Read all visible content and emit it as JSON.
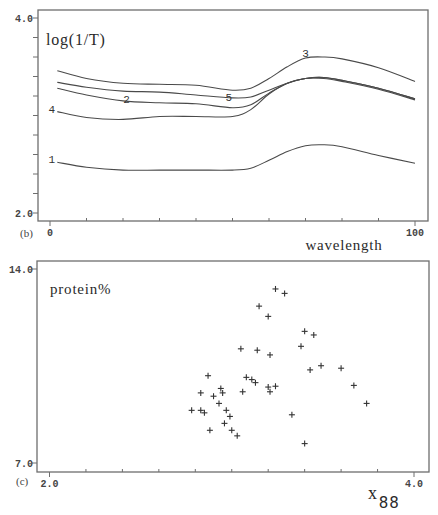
{
  "chart_data": [
    {
      "type": "line",
      "panel_label": "(b)",
      "title": "",
      "ylabel": "log(1/T)",
      "xlabel": "wavelength",
      "xlim": [
        0,
        100
      ],
      "ylim": [
        2.0,
        4.0
      ],
      "xtick_labels": [
        "0",
        "100"
      ],
      "ytick_labels": [
        "4.0",
        "2.0"
      ],
      "minor_ticks": {
        "x_count": 10,
        "y_count": 10
      },
      "grid": false,
      "legend": "inline curve numbers",
      "x": [
        2,
        10,
        20,
        30,
        40,
        50,
        55,
        60,
        65,
        70,
        75,
        80,
        90,
        100
      ],
      "series": [
        {
          "name": "1",
          "values": [
            2.52,
            2.47,
            2.44,
            2.44,
            2.44,
            2.44,
            2.46,
            2.54,
            2.63,
            2.69,
            2.7,
            2.68,
            2.59,
            2.51
          ]
        },
        {
          "name": "2",
          "values": [
            3.28,
            3.21,
            3.15,
            3.13,
            3.12,
            3.08,
            3.11,
            3.23,
            3.33,
            3.38,
            3.38,
            3.35,
            3.27,
            3.16
          ]
        },
        {
          "name": "3",
          "values": [
            3.46,
            3.38,
            3.33,
            3.32,
            3.31,
            3.26,
            3.28,
            3.38,
            3.5,
            3.59,
            3.6,
            3.58,
            3.49,
            3.35
          ]
        },
        {
          "name": "4",
          "values": [
            3.04,
            2.98,
            2.96,
            2.99,
            2.99,
            2.99,
            3.06,
            3.22,
            3.33,
            3.38,
            3.39,
            3.36,
            3.28,
            3.17
          ]
        },
        {
          "name": "5",
          "values": [
            3.34,
            3.29,
            3.25,
            3.24,
            3.21,
            3.18,
            3.19,
            3.26,
            3.33,
            3.38,
            3.39,
            3.36,
            3.28,
            3.17
          ]
        }
      ],
      "annotations": [
        {
          "text": "1",
          "x": 0.5,
          "y": 2.55
        },
        {
          "text": "2",
          "x": 21,
          "y": 3.17
        },
        {
          "text": "3",
          "x": 70,
          "y": 3.64
        },
        {
          "text": "4",
          "x": 0.5,
          "y": 3.07
        },
        {
          "text": "5",
          "x": 49,
          "y": 3.19
        }
      ]
    },
    {
      "type": "scatter",
      "panel_label": "(c)",
      "title": "",
      "ylabel": "protein%",
      "xlabel": {
        "base": "x",
        "sub": "88"
      },
      "xlim": [
        2.0,
        4.0
      ],
      "ylim": [
        7.0,
        14.0
      ],
      "xtick_labels": [
        "2.0",
        "4.0"
      ],
      "ytick_labels": [
        "14.0",
        "7.0"
      ],
      "minor_ticks": {
        "x_count": 10,
        "y_count": 1
      },
      "grid": false,
      "marker": "+",
      "points": [
        [
          3.24,
          13.28
        ],
        [
          3.29,
          13.12
        ],
        [
          3.15,
          12.66
        ],
        [
          3.2,
          12.29
        ],
        [
          3.4,
          11.75
        ],
        [
          3.45,
          11.62
        ],
        [
          3.38,
          11.21
        ],
        [
          3.05,
          11.12
        ],
        [
          3.14,
          11.07
        ],
        [
          3.21,
          10.9
        ],
        [
          3.49,
          10.51
        ],
        [
          3.43,
          10.36
        ],
        [
          3.6,
          10.42
        ],
        [
          2.87,
          10.15
        ],
        [
          3.08,
          10.09
        ],
        [
          3.11,
          10.01
        ],
        [
          3.13,
          9.9
        ],
        [
          3.67,
          9.8
        ],
        [
          2.94,
          9.69
        ],
        [
          3.2,
          9.74
        ],
        [
          3.24,
          9.77
        ],
        [
          2.83,
          9.53
        ],
        [
          2.95,
          9.53
        ],
        [
          3.06,
          9.57
        ],
        [
          3.21,
          9.57
        ],
        [
          2.9,
          9.41
        ],
        [
          2.93,
          9.15
        ],
        [
          2.78,
          8.9
        ],
        [
          2.83,
          8.9
        ],
        [
          2.85,
          8.81
        ],
        [
          2.97,
          8.9
        ],
        [
          2.99,
          8.68
        ],
        [
          2.96,
          8.43
        ],
        [
          3.33,
          8.74
        ],
        [
          2.88,
          8.18
        ],
        [
          3.0,
          8.18
        ],
        [
          3.03,
          7.98
        ],
        [
          3.4,
          7.7
        ],
        [
          3.74,
          9.15
        ]
      ]
    }
  ]
}
